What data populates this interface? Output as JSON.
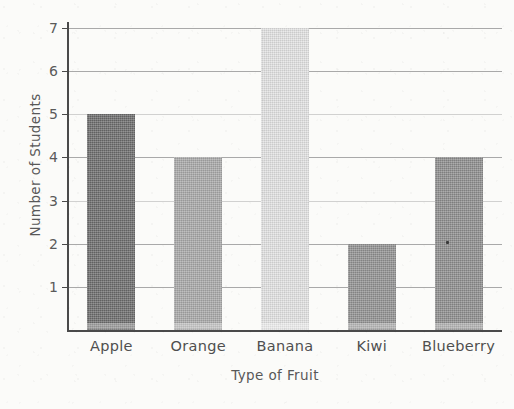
{
  "chart_data": {
    "type": "bar",
    "title": "",
    "subtitle": "",
    "categories": [
      "Apple",
      "Orange",
      "Banana",
      "Kiwi",
      "Blueberry"
    ],
    "values": [
      5,
      4,
      7,
      2,
      4
    ],
    "series": [
      {
        "name": "Number of Students",
        "values": [
          5,
          4,
          7,
          2,
          4
        ]
      }
    ],
    "xlabel": "Type of Fruit",
    "ylabel": "Number of Students",
    "ylim": [
      0,
      7
    ],
    "xlim": [
      0,
      5
    ],
    "y_ticks": [
      1,
      2,
      3,
      4,
      5,
      6,
      7
    ],
    "y_tick_labels": [
      "1",
      "2",
      "3",
      "4",
      "5",
      "6",
      "7"
    ],
    "grid": true,
    "grid_axis": "y",
    "legend": false,
    "legend_position": "none",
    "bar_colors": [
      "#6b6b6b",
      "#a8a8a8",
      "#e2e2e2",
      "#919191",
      "#8d8d8d"
    ],
    "annotations": []
  },
  "axes": {
    "y_title": "Number of Students",
    "x_title": "Type of Fruit",
    "ticks": [
      {
        "label": "7",
        "value": 7
      },
      {
        "label": "6",
        "value": 6
      },
      {
        "label": "5",
        "value": 5
      },
      {
        "label": "4",
        "value": 4
      },
      {
        "label": "3",
        "value": 3
      },
      {
        "label": "2",
        "value": 2
      },
      {
        "label": "1",
        "value": 1
      }
    ]
  },
  "bars": [
    {
      "label": "Apple",
      "value": 5,
      "color": "#6b6b6b"
    },
    {
      "label": "Orange",
      "value": 4,
      "color": "#a8a8a8"
    },
    {
      "label": "Banana",
      "value": 7,
      "color": "#e2e2e2"
    },
    {
      "label": "Kiwi",
      "value": 2,
      "color": "#919191"
    },
    {
      "label": "Blueberry",
      "value": 4,
      "color": "#8d8d8d"
    }
  ],
  "style": {
    "background": "#fbfbf9",
    "axis_color": "#4a4a4a",
    "gridline_color": "#8d8d8d",
    "text_color": "#585858"
  }
}
